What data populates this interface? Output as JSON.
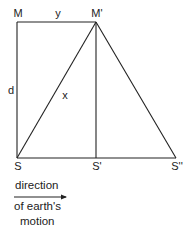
{
  "diagram": {
    "points": {
      "M": {
        "label": "M",
        "x": 17,
        "y": 22
      },
      "M_prime": {
        "label": "M'",
        "x": 96,
        "y": 22
      },
      "S": {
        "label": "S",
        "x": 17,
        "y": 158
      },
      "S_prime": {
        "label": "S'",
        "x": 96,
        "y": 158
      },
      "S_double_prime": {
        "label": "S''",
        "x": 176,
        "y": 158
      }
    },
    "segment_labels": {
      "y": "y",
      "d": "d",
      "x": "x"
    },
    "caption": {
      "line1": "direction",
      "line2": "of earth's",
      "line3": "motion"
    },
    "colors": {
      "stroke": "#222222",
      "background": "#ffffff"
    }
  }
}
